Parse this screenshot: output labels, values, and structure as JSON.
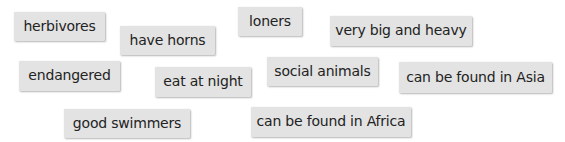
{
  "colors": {
    "tag_background": "#e3e3e3",
    "tag_text": "#222222",
    "page_background": "#ffffff"
  },
  "tags": [
    {
      "label": "herbivores",
      "x": 14,
      "y": 12,
      "w": 91,
      "h": 29
    },
    {
      "label": "have horns",
      "x": 120,
      "y": 26,
      "w": 95,
      "h": 29
    },
    {
      "label": "loners",
      "x": 238,
      "y": 7,
      "w": 64,
      "h": 29
    },
    {
      "label": "very big and heavy",
      "x": 330,
      "y": 16,
      "w": 142,
      "h": 30
    },
    {
      "label": "endangered",
      "x": 19,
      "y": 61,
      "w": 101,
      "h": 30
    },
    {
      "label": "eat at night",
      "x": 155,
      "y": 67,
      "w": 96,
      "h": 30
    },
    {
      "label": "social animals",
      "x": 267,
      "y": 57,
      "w": 111,
      "h": 29
    },
    {
      "label": "can be found in Asia",
      "x": 399,
      "y": 62,
      "w": 153,
      "h": 31
    },
    {
      "label": "good swimmers",
      "x": 64,
      "y": 109,
      "w": 126,
      "h": 29
    },
    {
      "label": "can be found in Africa",
      "x": 251,
      "y": 107,
      "w": 160,
      "h": 30
    }
  ]
}
